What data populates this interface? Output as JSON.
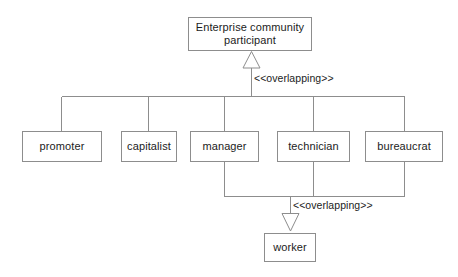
{
  "diagram": {
    "type": "uml-generalization-hierarchy",
    "background_color": "#ffffff",
    "line_color": "#8d8d8d",
    "text_color": "#1c1c1c",
    "classes": {
      "root": {
        "name": "Enterprise community\nparticipant"
      },
      "promoter": {
        "name": "promoter"
      },
      "capitalist": {
        "name": "capitalist"
      },
      "manager": {
        "name": "manager"
      },
      "technician": {
        "name": "technician"
      },
      "bureaucrat": {
        "name": "bureaucrat"
      },
      "worker": {
        "name": "worker"
      }
    },
    "labels": {
      "top_constraint": "<<overlapping>>",
      "bottom_constraint": "<<overlapping>>"
    },
    "generalizations": [
      {
        "parent": "Enterprise community participant",
        "children": [
          "promoter",
          "capitalist",
          "manager",
          "technician",
          "bureaucrat"
        ],
        "constraint": "<<overlapping>>"
      },
      {
        "parent": "worker",
        "children": [
          "manager",
          "technician",
          "bureaucrat"
        ],
        "constraint": "<<overlapping>>"
      }
    ]
  }
}
